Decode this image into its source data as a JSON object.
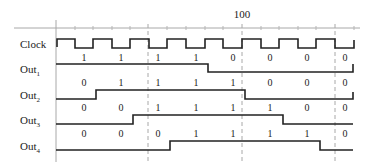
{
  "diagram": {
    "type": "timing-diagram",
    "axis_label": "100",
    "signals": [
      {
        "name": "Clock",
        "sub": ""
      },
      {
        "name": "Out",
        "sub": "1",
        "values": [
          "1",
          "1",
          "1",
          "1",
          "0",
          "0",
          "0",
          "0"
        ]
      },
      {
        "name": "Out",
        "sub": "2",
        "values": [
          "0",
          "1",
          "1",
          "1",
          "1",
          "0",
          "0",
          "0"
        ]
      },
      {
        "name": "Out",
        "sub": "3",
        "values": [
          "0",
          "0",
          "1",
          "1",
          "1",
          "1",
          "0",
          "0"
        ]
      },
      {
        "name": "Out",
        "sub": "4",
        "values": [
          "0",
          "0",
          "0",
          "1",
          "1",
          "1",
          "1",
          "0"
        ]
      }
    ],
    "colors": {
      "line": "#222222",
      "axis": "#9a9a9a",
      "dashed": "#9a9a9a"
    }
  }
}
